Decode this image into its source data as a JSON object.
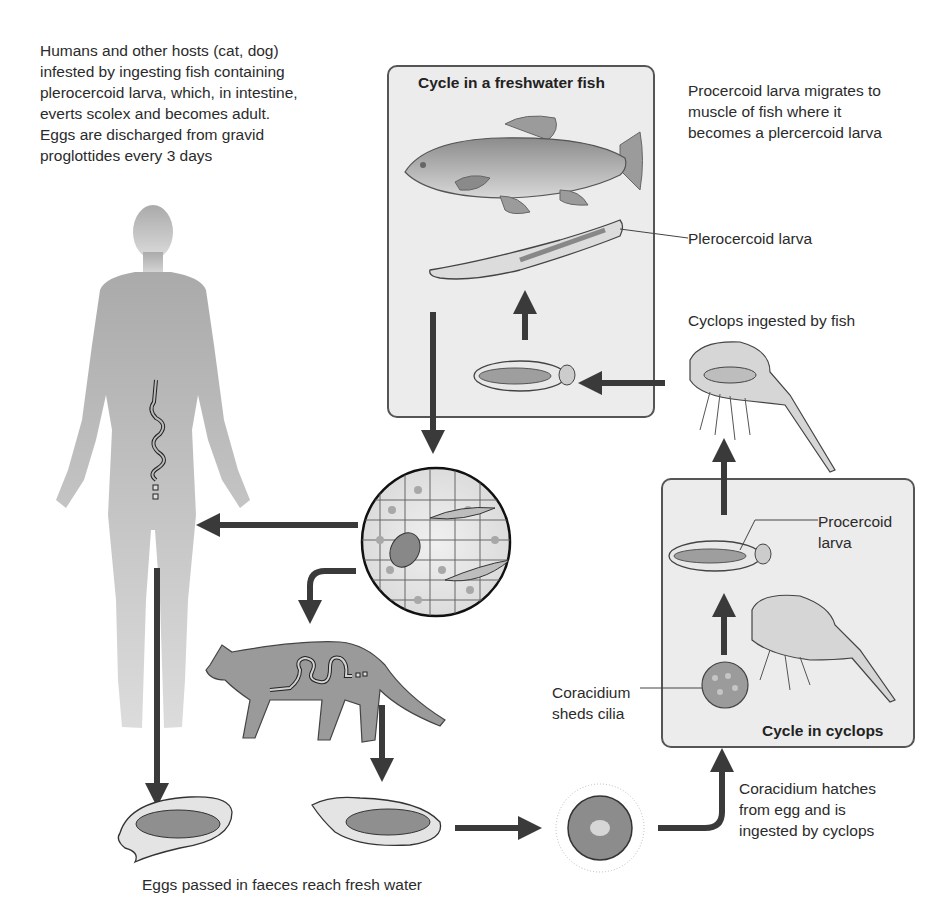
{
  "diagram": {
    "annotations": {
      "humans_hosts": "Humans and other hosts (cat, dog)\ninfested by ingesting fish containing\nplerocercoid larva, which, in intestine,\neverts scolex and becomes adult.\nEggs are discharged from gravid\nproglottides every 3 days",
      "procercoid_migrates": "Procercoid larva migrates to\nmuscle of fish where it\nbecomes a plercercoid larva",
      "plerocercoid_label": "Plerocercoid larva",
      "cyclops_ingested": "Cyclops ingested by fish",
      "procercoid_label": "Procercoid\nlarva",
      "coracidium_sheds": "Coracidium\nsheds cilia",
      "coracidium_hatches": "Coracidium hatches\nfrom egg and is\ningested by cyclops",
      "eggs_passed": "Eggs passed in faeces reach fresh water"
    },
    "boxes": {
      "fish_cycle_title": "Cycle in a freshwater fish",
      "cyclops_cycle_title": "Cycle in cyclops"
    },
    "stages": [
      "Adult worm in human intestine",
      "Adult worm in cat intestine",
      "Egg in faeces (human)",
      "Egg in faeces (cat)",
      "Ciliated coracidium",
      "Coracidium sheds cilia",
      "Procercoid larva in cyclops",
      "Cyclops ingested by fish",
      "Plerocercoid larva in fish muscle",
      "Encysted larvae in fish muscle tissue"
    ],
    "colors": {
      "box_fill": "#ececec",
      "box_border": "#555555",
      "arrow": "#3a3a3a",
      "human_silhouette": "#b3b3b3",
      "cat_fill": "#9a9a9a"
    }
  }
}
